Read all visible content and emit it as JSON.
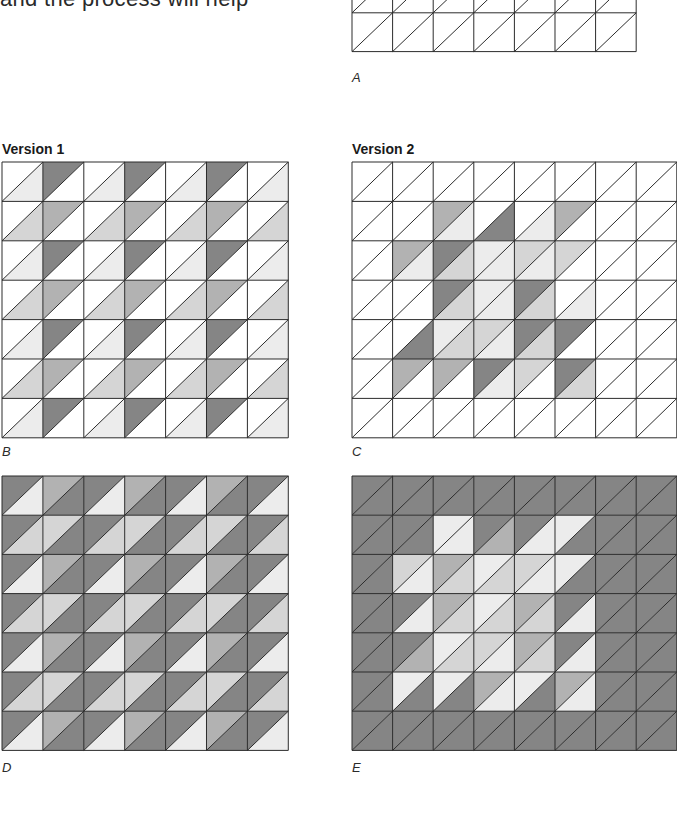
{
  "page": {
    "intro_text": "and the process will help"
  },
  "palette": {
    "W": "#ffffff",
    "L": "#ececec",
    "M": "#d5d5d5",
    "G": "#b2b2b2",
    "D": "#858585",
    "line": "#2b2b2b"
  },
  "figures": [
    {
      "id": "A",
      "label": "A",
      "title": "",
      "x": 352,
      "y": -26,
      "cell_w": 40.6,
      "cell_h": 38.8,
      "cols": 7,
      "rows": 2,
      "cells": [
        [
          [
            "W",
            "W"
          ],
          [
            "W",
            "W"
          ],
          [
            "W",
            "W"
          ],
          [
            "W",
            "W"
          ],
          [
            "W",
            "W"
          ],
          [
            "W",
            "W"
          ],
          [
            "W",
            "W"
          ]
        ],
        [
          [
            "W",
            "W"
          ],
          [
            "W",
            "W"
          ],
          [
            "W",
            "W"
          ],
          [
            "W",
            "W"
          ],
          [
            "W",
            "W"
          ],
          [
            "W",
            "W"
          ],
          [
            "W",
            "W"
          ]
        ]
      ]
    },
    {
      "id": "B",
      "label": "B",
      "title": "Version 1",
      "x": 2,
      "y": 162,
      "cell_w": 40.9,
      "cell_h": 39.4,
      "cols": 7,
      "rows": 7,
      "cells": [
        [
          [
            "W",
            "L"
          ],
          [
            "D",
            "W"
          ],
          [
            "W",
            "L"
          ],
          [
            "D",
            "W"
          ],
          [
            "W",
            "L"
          ],
          [
            "D",
            "W"
          ],
          [
            "W",
            "L"
          ]
        ],
        [
          [
            "W",
            "M"
          ],
          [
            "G",
            "W"
          ],
          [
            "W",
            "M"
          ],
          [
            "G",
            "W"
          ],
          [
            "W",
            "M"
          ],
          [
            "G",
            "W"
          ],
          [
            "W",
            "M"
          ]
        ],
        [
          [
            "W",
            "L"
          ],
          [
            "D",
            "W"
          ],
          [
            "W",
            "L"
          ],
          [
            "D",
            "W"
          ],
          [
            "W",
            "L"
          ],
          [
            "D",
            "W"
          ],
          [
            "W",
            "L"
          ]
        ],
        [
          [
            "W",
            "M"
          ],
          [
            "G",
            "W"
          ],
          [
            "W",
            "M"
          ],
          [
            "G",
            "W"
          ],
          [
            "W",
            "M"
          ],
          [
            "G",
            "W"
          ],
          [
            "W",
            "M"
          ]
        ],
        [
          [
            "W",
            "L"
          ],
          [
            "D",
            "W"
          ],
          [
            "W",
            "L"
          ],
          [
            "D",
            "W"
          ],
          [
            "W",
            "L"
          ],
          [
            "D",
            "W"
          ],
          [
            "W",
            "L"
          ]
        ],
        [
          [
            "W",
            "M"
          ],
          [
            "G",
            "W"
          ],
          [
            "W",
            "M"
          ],
          [
            "G",
            "W"
          ],
          [
            "W",
            "M"
          ],
          [
            "G",
            "W"
          ],
          [
            "W",
            "M"
          ]
        ],
        [
          [
            "W",
            "L"
          ],
          [
            "D",
            "W"
          ],
          [
            "W",
            "L"
          ],
          [
            "D",
            "W"
          ],
          [
            "W",
            "L"
          ],
          [
            "D",
            "W"
          ],
          [
            "W",
            "L"
          ]
        ]
      ]
    },
    {
      "id": "C",
      "label": "C",
      "title": "Version 2",
      "x": 352,
      "y": 162,
      "cell_w": 40.6,
      "cell_h": 39.4,
      "cols": 8,
      "rows": 7,
      "cells": [
        [
          [
            "W",
            "W"
          ],
          [
            "W",
            "W"
          ],
          [
            "W",
            "W"
          ],
          [
            "W",
            "W"
          ],
          [
            "W",
            "W"
          ],
          [
            "W",
            "W"
          ],
          [
            "W",
            "W"
          ],
          [
            "W",
            "W"
          ]
        ],
        [
          [
            "W",
            "W"
          ],
          [
            "W",
            "W"
          ],
          [
            "G",
            "L"
          ],
          [
            "W",
            "D"
          ],
          [
            "W",
            "L"
          ],
          [
            "G",
            "W"
          ],
          [
            "W",
            "W"
          ],
          [
            "W",
            "W"
          ]
        ],
        [
          [
            "W",
            "W"
          ],
          [
            "G",
            "L"
          ],
          [
            "D",
            "M"
          ],
          [
            "L",
            "L"
          ],
          [
            "M",
            "L"
          ],
          [
            "M",
            "W"
          ],
          [
            "W",
            "W"
          ],
          [
            "W",
            "W"
          ]
        ],
        [
          [
            "W",
            "W"
          ],
          [
            "W",
            "W"
          ],
          [
            "D",
            "M"
          ],
          [
            "L",
            "L"
          ],
          [
            "D",
            "M"
          ],
          [
            "W",
            "L"
          ],
          [
            "W",
            "W"
          ],
          [
            "W",
            "W"
          ]
        ],
        [
          [
            "W",
            "W"
          ],
          [
            "W",
            "D"
          ],
          [
            "L",
            "M"
          ],
          [
            "M",
            "L"
          ],
          [
            "D",
            "M"
          ],
          [
            "D",
            "W"
          ],
          [
            "W",
            "W"
          ],
          [
            "W",
            "W"
          ]
        ],
        [
          [
            "W",
            "W"
          ],
          [
            "G",
            "W"
          ],
          [
            "G",
            "W"
          ],
          [
            "D",
            "L"
          ],
          [
            "M",
            "W"
          ],
          [
            "D",
            "M"
          ],
          [
            "W",
            "W"
          ],
          [
            "W",
            "W"
          ]
        ],
        [
          [
            "W",
            "W"
          ],
          [
            "W",
            "W"
          ],
          [
            "W",
            "W"
          ],
          [
            "W",
            "W"
          ],
          [
            "W",
            "W"
          ],
          [
            "W",
            "W"
          ],
          [
            "W",
            "W"
          ],
          [
            "W",
            "W"
          ]
        ]
      ]
    },
    {
      "id": "D",
      "label": "D",
      "title": "",
      "x": 2,
      "y": 476,
      "cell_w": 40.9,
      "cell_h": 39.2,
      "cols": 7,
      "rows": 7,
      "cells": [
        [
          [
            "D",
            "L"
          ],
          [
            "G",
            "D"
          ],
          [
            "D",
            "L"
          ],
          [
            "G",
            "D"
          ],
          [
            "D",
            "L"
          ],
          [
            "G",
            "D"
          ],
          [
            "D",
            "L"
          ]
        ],
        [
          [
            "D",
            "M"
          ],
          [
            "M",
            "D"
          ],
          [
            "D",
            "M"
          ],
          [
            "M",
            "D"
          ],
          [
            "D",
            "M"
          ],
          [
            "M",
            "D"
          ],
          [
            "D",
            "M"
          ]
        ],
        [
          [
            "D",
            "L"
          ],
          [
            "G",
            "D"
          ],
          [
            "D",
            "L"
          ],
          [
            "G",
            "D"
          ],
          [
            "D",
            "L"
          ],
          [
            "G",
            "D"
          ],
          [
            "D",
            "L"
          ]
        ],
        [
          [
            "D",
            "M"
          ],
          [
            "M",
            "D"
          ],
          [
            "D",
            "M"
          ],
          [
            "M",
            "D"
          ],
          [
            "D",
            "M"
          ],
          [
            "M",
            "D"
          ],
          [
            "D",
            "M"
          ]
        ],
        [
          [
            "D",
            "L"
          ],
          [
            "G",
            "D"
          ],
          [
            "D",
            "L"
          ],
          [
            "G",
            "D"
          ],
          [
            "D",
            "L"
          ],
          [
            "G",
            "D"
          ],
          [
            "D",
            "L"
          ]
        ],
        [
          [
            "D",
            "M"
          ],
          [
            "M",
            "D"
          ],
          [
            "D",
            "M"
          ],
          [
            "M",
            "D"
          ],
          [
            "D",
            "M"
          ],
          [
            "M",
            "D"
          ],
          [
            "D",
            "M"
          ]
        ],
        [
          [
            "D",
            "L"
          ],
          [
            "G",
            "D"
          ],
          [
            "D",
            "L"
          ],
          [
            "G",
            "D"
          ],
          [
            "D",
            "L"
          ],
          [
            "G",
            "D"
          ],
          [
            "D",
            "L"
          ]
        ]
      ]
    },
    {
      "id": "E",
      "label": "E",
      "title": "",
      "x": 352,
      "y": 476,
      "cell_w": 40.6,
      "cell_h": 39.2,
      "cols": 8,
      "rows": 7,
      "cells": [
        [
          [
            "D",
            "D"
          ],
          [
            "D",
            "D"
          ],
          [
            "D",
            "D"
          ],
          [
            "D",
            "D"
          ],
          [
            "D",
            "D"
          ],
          [
            "D",
            "D"
          ],
          [
            "D",
            "D"
          ],
          [
            "D",
            "D"
          ]
        ],
        [
          [
            "D",
            "D"
          ],
          [
            "D",
            "D"
          ],
          [
            "L",
            "L"
          ],
          [
            "D",
            "G"
          ],
          [
            "D",
            "L"
          ],
          [
            "L",
            "D"
          ],
          [
            "D",
            "D"
          ],
          [
            "D",
            "D"
          ]
        ],
        [
          [
            "D",
            "D"
          ],
          [
            "M",
            "L"
          ],
          [
            "G",
            "M"
          ],
          [
            "L",
            "M"
          ],
          [
            "M",
            "L"
          ],
          [
            "L",
            "D"
          ],
          [
            "D",
            "D"
          ],
          [
            "D",
            "D"
          ]
        ],
        [
          [
            "D",
            "D"
          ],
          [
            "D",
            "L"
          ],
          [
            "G",
            "M"
          ],
          [
            "L",
            "M"
          ],
          [
            "G",
            "M"
          ],
          [
            "D",
            "L"
          ],
          [
            "D",
            "D"
          ],
          [
            "D",
            "D"
          ]
        ],
        [
          [
            "D",
            "D"
          ],
          [
            "D",
            "G"
          ],
          [
            "L",
            "M"
          ],
          [
            "M",
            "L"
          ],
          [
            "G",
            "M"
          ],
          [
            "D",
            "L"
          ],
          [
            "D",
            "D"
          ],
          [
            "D",
            "D"
          ]
        ],
        [
          [
            "D",
            "D"
          ],
          [
            "L",
            "D"
          ],
          [
            "L",
            "D"
          ],
          [
            "G",
            "L"
          ],
          [
            "L",
            "D"
          ],
          [
            "G",
            "L"
          ],
          [
            "D",
            "D"
          ],
          [
            "D",
            "D"
          ]
        ],
        [
          [
            "D",
            "D"
          ],
          [
            "D",
            "D"
          ],
          [
            "D",
            "D"
          ],
          [
            "D",
            "D"
          ],
          [
            "D",
            "D"
          ],
          [
            "D",
            "D"
          ],
          [
            "D",
            "D"
          ],
          [
            "D",
            "D"
          ]
        ]
      ]
    }
  ]
}
